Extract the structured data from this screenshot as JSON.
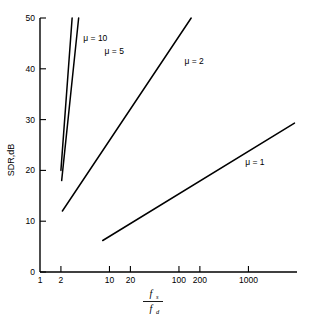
{
  "chart_data": {
    "type": "line",
    "title": "",
    "subtitle": "",
    "xlabel_numerator": "f",
    "xlabel_numerator_sub": "s",
    "xlabel_denominator": "f",
    "xlabel_denominator_sub": "d",
    "xlabel_text": "fs/fd",
    "ylabel": "SDR,dB",
    "xscale": "log",
    "yscale": "linear",
    "xlim": [
      1,
      5000
    ],
    "ylim": [
      0,
      50
    ],
    "grid": false,
    "legend_position": "inline-annotations",
    "xticks": [
      {
        "value": 1,
        "label": "1"
      },
      {
        "value": 2,
        "label": "2"
      },
      {
        "value": 10,
        "label": "10"
      },
      {
        "value": 20,
        "label": "20"
      },
      {
        "value": 100,
        "label": "100"
      },
      {
        "value": 200,
        "label": "200"
      },
      {
        "value": 1000,
        "label": "1000"
      }
    ],
    "yticks": [
      {
        "value": 0,
        "label": "0"
      },
      {
        "value": 10,
        "label": "10"
      },
      {
        "value": 20,
        "label": "20"
      },
      {
        "value": 30,
        "label": "30"
      },
      {
        "value": 40,
        "label": "40"
      },
      {
        "value": 50,
        "label": "50"
      }
    ],
    "series": [
      {
        "name": "mu10",
        "label": "μ = 10",
        "label_x": 4.2,
        "label_y": 45.5,
        "points": [
          [
            2.0,
            20.0
          ],
          [
            2.9,
            50.0
          ]
        ]
      },
      {
        "name": "mu5",
        "label": "μ = 5",
        "label_x": 8.5,
        "label_y": 43.0,
        "points": [
          [
            2.05,
            18.0
          ],
          [
            3.6,
            50.0
          ]
        ]
      },
      {
        "name": "mu2",
        "label": "μ = 2",
        "label_x": 120,
        "label_y": 41.0,
        "points": [
          [
            2.1,
            12.0
          ],
          [
            150,
            50.0
          ]
        ]
      },
      {
        "name": "mu1",
        "label": "μ = 1",
        "label_x": 900,
        "label_y": 21.0,
        "points": [
          [
            8.0,
            6.2
          ],
          [
            4600,
            29.3
          ]
        ]
      }
    ]
  }
}
